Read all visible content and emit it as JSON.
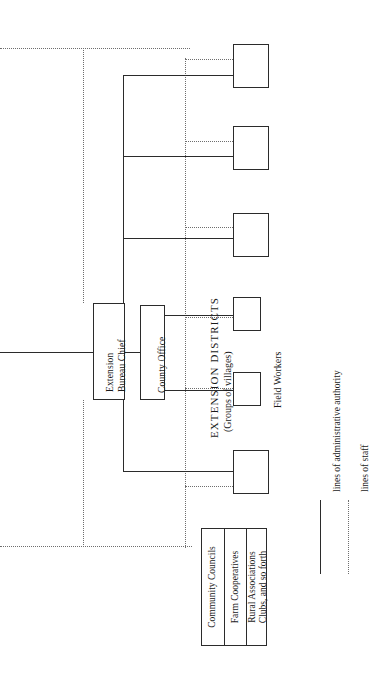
{
  "diagram": {
    "orientation": "rotated-90-counterclockwise",
    "colors": {
      "line_solid": "#2b2b2b",
      "line_dotted": "#6e6e6e",
      "box_fill": "#ffffff",
      "text": "#1a1a1a",
      "background": "#ffffff"
    }
  },
  "nodes": {
    "bureau_chief": {
      "label_line_1": "Extension",
      "label_line_2": "Bureau Chief"
    },
    "county_office": {
      "label": "County Office"
    },
    "district_boxes": [
      {
        "label": ""
      },
      {
        "label": ""
      },
      {
        "label": ""
      },
      {
        "label": ""
      },
      {
        "label": ""
      },
      {
        "label": ""
      }
    ]
  },
  "group_labels": {
    "extension_districts_line_1": "EXTENSION DISTRICTS",
    "extension_districts_line_2": "(Groups of villages)",
    "field_workers": "Field Workers"
  },
  "local_organizations": {
    "cells": [
      {
        "line_1": "Community Councils",
        "line_2": ""
      },
      {
        "line_1": "Farm Cooperatives",
        "line_2": ""
      },
      {
        "line_1": "Rural Associations",
        "line_2": "Clubs, and so forth"
      }
    ]
  },
  "legend": {
    "items": [
      {
        "style": "solid",
        "label": "lines of administrative authority"
      },
      {
        "style": "dotted",
        "label": "lines of staff"
      }
    ]
  }
}
